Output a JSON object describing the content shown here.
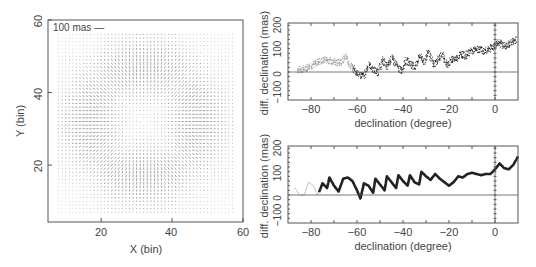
{
  "figure": {
    "width": 536,
    "height": 267,
    "colors": {
      "axis": "#555555",
      "text": "#444444",
      "vector": "#555555",
      "series_light": "#9a9a9a",
      "series_dark": "#222222"
    }
  },
  "chart_data": [
    {
      "id": "vector-field",
      "type": "quiver",
      "title": "",
      "xlabel": "X (bin)",
      "ylabel": "Y (bin)",
      "xlim": [
        5,
        60
      ],
      "ylim": [
        4.3,
        60
      ],
      "xticks": [
        20,
        40,
        60
      ],
      "yticks": [
        20,
        40,
        60
      ],
      "annotation": "100 mas —",
      "grid": false,
      "field": {
        "description": "radial distortion pattern centred near (32, 32) bins; vectors ~1 bin apart over x 8-57, y 7-56",
        "center": [
          32,
          32
        ],
        "x_range": [
          8,
          57
        ],
        "y_range": [
          7,
          56
        ],
        "spacing": 1.0,
        "ring_radius_bins": 15
      }
    },
    {
      "id": "dec-diff-top",
      "type": "scatter",
      "title": "",
      "xlabel": "declination (degree)",
      "ylabel": "diff. declination (mas)",
      "xlim": [
        -90,
        10
      ],
      "ylim": [
        -120,
        210
      ],
      "xticks": [
        -80,
        -60,
        -40,
        -20,
        0
      ],
      "yticks": [
        -100,
        0,
        100,
        200
      ],
      "hlines": [
        0
      ],
      "vlines": [
        0
      ],
      "grid": false,
      "x": [
        -86,
        -83,
        -80,
        -77,
        -74,
        -71,
        -68,
        -65,
        -63,
        -61,
        -59,
        -57,
        -55,
        -53,
        -51,
        -49,
        -47,
        -45,
        -43,
        -41,
        -39,
        -37,
        -35,
        -33,
        -31,
        -29,
        -27,
        -25,
        -23,
        -21,
        -19,
        -17,
        -15,
        -13,
        -11,
        -9,
        -7,
        -5,
        -3,
        -1,
        1,
        3,
        5,
        7,
        9
      ],
      "values": [
        10,
        15,
        30,
        45,
        55,
        50,
        40,
        65,
        30,
        5,
        -10,
        -15,
        35,
        10,
        0,
        55,
        20,
        65,
        30,
        5,
        50,
        40,
        20,
        70,
        45,
        90,
        30,
        55,
        75,
        30,
        55,
        60,
        80,
        70,
        90,
        95,
        100,
        90,
        100,
        110,
        130,
        120,
        110,
        130,
        140
      ]
    },
    {
      "id": "dec-diff-bottom",
      "type": "line",
      "title": "",
      "xlabel": "declination (degree)",
      "ylabel": "diff. declination (mas)",
      "xlim": [
        -90,
        10
      ],
      "ylim": [
        -120,
        210
      ],
      "xticks": [
        -80,
        -60,
        -40,
        -20,
        0
      ],
      "yticks": [
        -100,
        0,
        100,
        200
      ],
      "hlines": [
        0
      ],
      "vlines": [
        0
      ],
      "grid": false,
      "x": [
        -87,
        -85,
        -83,
        -81,
        -79,
        -77,
        -75,
        -73,
        -72,
        -70,
        -68,
        -66,
        -64,
        -62,
        -60,
        -58.5,
        -57,
        -55,
        -53,
        -52,
        -50,
        -48,
        -47,
        -45,
        -43,
        -42,
        -40,
        -38,
        -37,
        -35,
        -33,
        -32,
        -30,
        -28,
        -26,
        -24,
        -22,
        -20,
        -18,
        -16,
        -14,
        -12,
        -10,
        -8,
        -6,
        -4,
        -2,
        0,
        2,
        4,
        6,
        8,
        10
      ],
      "values": [
        30,
        0,
        0,
        55,
        40,
        0,
        50,
        30,
        75,
        40,
        15,
        70,
        75,
        60,
        20,
        -15,
        50,
        40,
        10,
        70,
        45,
        20,
        80,
        55,
        30,
        85,
        60,
        40,
        85,
        55,
        45,
        100,
        80,
        65,
        90,
        70,
        55,
        40,
        55,
        80,
        75,
        90,
        95,
        90,
        85,
        90,
        90,
        110,
        135,
        115,
        110,
        130,
        165
      ],
      "light_segment_until_x": -76
    }
  ],
  "axes": {
    "left": {
      "xlabel": "X (bin)",
      "ylabel": "Y (bin)",
      "xtick_labels": [
        "20",
        "40",
        "60"
      ],
      "ytick_labels": [
        "20",
        "40",
        "60"
      ],
      "scale_label": "100 mas —"
    },
    "top_right": {
      "xlabel": "declination (degree)",
      "ylabel": "diff. declination (mas)",
      "xtick_labels": [
        "−80",
        "−60",
        "−40",
        "−20",
        "0"
      ],
      "ytick_labels": [
        "−100",
        "0",
        "100",
        "200"
      ]
    },
    "bottom_right": {
      "xlabel": "declination (degree)",
      "ylabel": "diff. declination (mas)",
      "xtick_labels": [
        "−80",
        "−60",
        "−40",
        "−20",
        "0"
      ],
      "ytick_labels": [
        "−100",
        "0",
        "100",
        "200"
      ]
    }
  }
}
